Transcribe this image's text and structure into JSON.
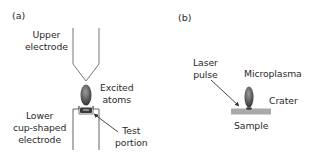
{
  "panel_a": {
    "tag": "(a)",
    "labels": {
      "upper_electrode": [
        "Upper",
        "electrode"
      ],
      "excited_atoms": [
        "Excited",
        "atoms"
      ],
      "lower_electrode": [
        "Lower",
        "cup-shaped",
        "electrode"
      ],
      "test_portion": [
        "Test",
        "portion"
      ]
    }
  },
  "panel_b": {
    "tag": "(b)",
    "labels": {
      "laser_pulse": [
        "Laser",
        "pulse"
      ],
      "microplasma": "Microplasma",
      "crater": "Crater",
      "sample": "Sample"
    }
  },
  "colors": {
    "line": "#555555",
    "plasma_dark": "#3a3a3a",
    "plasma_light": "#9a9a9a",
    "sample": "#a8a8a8",
    "test_portion": "#3c3c3c"
  }
}
